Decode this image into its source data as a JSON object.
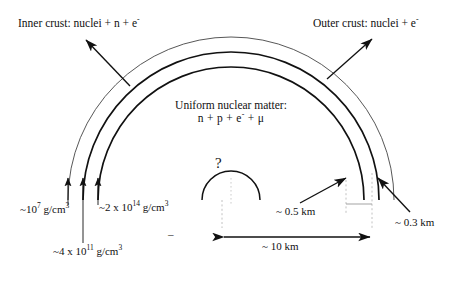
{
  "diagram": {
    "title_alt": "Neutron star cross-section",
    "labels": {
      "inner_crust": "Inner crust: nuclei + n + e",
      "inner_crust_sup": "-",
      "outer_crust": "Outer crust: nuclei  + e",
      "outer_crust_sup": "-",
      "core_line1": "Uniform nuclear matter:",
      "core_line2": "n + p + e",
      "core_line2_sup": "-",
      "core_line2_tail": " + μ",
      "question_mark": "?",
      "stray_dash": "–"
    },
    "densities": [
      {
        "id": "rho-outer",
        "prefix": "~10",
        "exponent": "7",
        "unit": " g/cm",
        "unit_exp": "3",
        "full": "~10^7 g/cm^3"
      },
      {
        "id": "rho-inner",
        "prefix": "~2 x 10",
        "exponent": "14",
        "unit": " g/cm",
        "unit_exp": "3",
        "full": "~2 x 10^14 g/cm^3"
      },
      {
        "id": "rho-neutron-drip",
        "prefix": "~4 x 10",
        "exponent": "11",
        "unit": " g/cm",
        "unit_exp": "3",
        "full": "~4 x 10^11 g/cm^3"
      }
    ],
    "dimensions": [
      {
        "id": "inner-crust-thickness",
        "text": "~ 0.5 km"
      },
      {
        "id": "outer-crust-thickness",
        "text": "~ 0.3 km"
      },
      {
        "id": "star-radius",
        "text": "~ 10 km"
      }
    ],
    "colors": {
      "stroke": "#111111",
      "stroke_light": "#555555",
      "dashed": "#bbbbbb",
      "background": "#ffffff"
    },
    "geometry": {
      "center_x": 231,
      "center_y": 200,
      "radii": [
        163,
        148,
        133
      ],
      "core_radius": 29
    }
  }
}
